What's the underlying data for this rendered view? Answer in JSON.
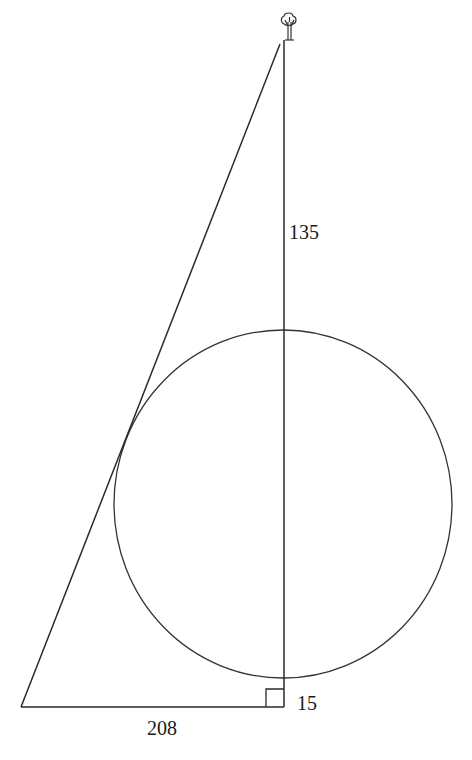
{
  "figure": {
    "type": "geometry-diagram",
    "labels": {
      "vertical_segment": "135",
      "base": "208",
      "small_segment": "15"
    },
    "icons": {
      "top": "tree-icon",
      "corner": "right-angle-marker"
    },
    "stroke_color": "#2a2a2a",
    "background": "#ffffff"
  }
}
